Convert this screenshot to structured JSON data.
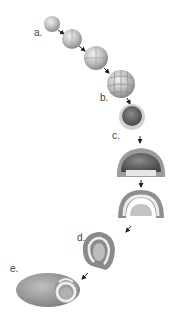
{
  "diagram": {
    "type": "embryonic-development-sequence",
    "stages": [
      {
        "id": "a",
        "label": "a.",
        "description": "zygote / early cleavage"
      },
      {
        "id": "b",
        "label": "b.",
        "description": "morula"
      },
      {
        "id": "c",
        "label": "c.",
        "description": "blastula"
      },
      {
        "id": "d",
        "label": "d.",
        "description": "gastrula"
      },
      {
        "id": "e",
        "label": "e.",
        "description": "neurula"
      }
    ],
    "colors": {
      "background": "#ffffff",
      "cell_light": "#d8d8d8",
      "cell_mid": "#a8a8a8",
      "cell_dark": "#5a5a5a",
      "arrow": "#222222",
      "label": "#444444"
    }
  }
}
